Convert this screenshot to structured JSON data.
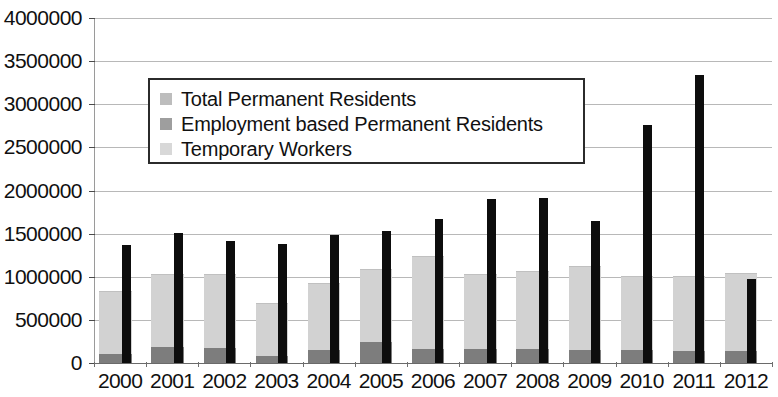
{
  "chart_data": {
    "type": "bar",
    "title": "",
    "subtitle": "",
    "xlabel": "",
    "ylabel": "",
    "grid": true,
    "legend_position": "inside-top-left",
    "categories": [
      "2000",
      "2001",
      "2002",
      "2003",
      "2004",
      "2005",
      "2006",
      "2007",
      "2008",
      "2009",
      "2010",
      "2011",
      "2012"
    ],
    "ylim": [
      0,
      4000000
    ],
    "ytick_labels": [
      "4000000",
      "3500000",
      "3000000",
      "2500000",
      "2000000",
      "1500000",
      "1000000",
      "500000",
      "0"
    ],
    "yticks": [
      4000000,
      3500000,
      3000000,
      2500000,
      2000000,
      1500000,
      1000000,
      500000,
      0
    ],
    "series": [
      {
        "name": "Total Permanent Residents",
        "color": "#d2d2d2",
        "values": [
          820000,
          1020000,
          1020000,
          690000,
          920000,
          1080000,
          1230000,
          1020000,
          1060000,
          1110000,
          1000000,
          1000000,
          1030000
        ]
      },
      {
        "name": "Employment based Permanent Residents",
        "color": "#7d7d7d",
        "values": [
          110000,
          180000,
          170000,
          80000,
          150000,
          240000,
          160000,
          160000,
          160000,
          150000,
          150000,
          140000,
          140000
        ]
      },
      {
        "name": "Temporary Workers",
        "color": "#0d0d0d",
        "values": [
          1370000,
          1510000,
          1420000,
          1380000,
          1480000,
          1530000,
          1670000,
          1900000,
          1910000,
          1650000,
          2760000,
          3340000,
          970000
        ]
      }
    ]
  },
  "legend": {
    "items": [
      {
        "label": "Total Permanent Residents",
        "swatch": "legend-swatch-total"
      },
      {
        "label": "Employment based Permanent Residents",
        "swatch": "legend-swatch-employment"
      },
      {
        "label": "Temporary Workers",
        "swatch": "legend-swatch-temporary"
      }
    ]
  }
}
